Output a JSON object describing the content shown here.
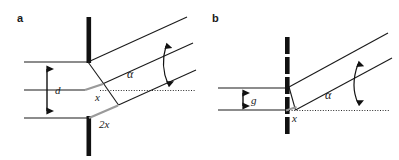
{
  "figure": {
    "background_color": "#ffffff",
    "ink_color": "#1a1a1a",
    "gray_color": "#9a9a9a",
    "wall_color": "#111111"
  },
  "panels": [
    {
      "id": "a",
      "label": "a",
      "labels": {
        "width_dim": "d",
        "offset_small": "x",
        "offset_large": "2x",
        "angle": "α"
      },
      "description": "wide channel of width d meeting a solid barrier, deflected downstream channel at angle alpha, with offsets x and 2x marked in gray at the junction"
    },
    {
      "id": "b",
      "label": "b",
      "labels": {
        "gap_dim": "g",
        "offset_small": "x",
        "angle": "α"
      },
      "description": "narrow gap g in a segmented barrier, deflected channel at angle alpha, with offset x marked in gray at the junction"
    }
  ]
}
